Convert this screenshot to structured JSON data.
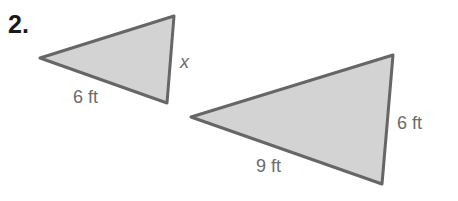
{
  "problem": {
    "number": "2."
  },
  "colors": {
    "fill": "#d3d3d3",
    "stroke": "#666666",
    "label": "#6b6b6b"
  },
  "triangles": [
    {
      "name": "small",
      "vertices": [
        [
          40,
          58
        ],
        [
          174,
          16
        ],
        [
          167,
          103
        ]
      ],
      "labels": {
        "bottom_side": "6 ft",
        "right_side": "x"
      }
    },
    {
      "name": "large",
      "vertices": [
        [
          191,
          117
        ],
        [
          393,
          55
        ],
        [
          382,
          184
        ]
      ],
      "labels": {
        "bottom_side": "9 ft",
        "right_side": "6 ft"
      }
    }
  ]
}
